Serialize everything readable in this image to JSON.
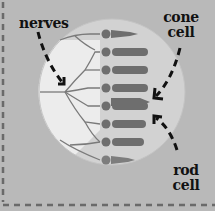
{
  "diagram": {
    "labels": {
      "nerves": "nerves",
      "cone_line1": "cone",
      "cone_line2": "cell",
      "rod_line1": "rod",
      "rod_line2": "cell"
    },
    "colors": {
      "background": "#b9b9b9",
      "lens": "#e8e8e8",
      "lens_shadow": "#cfcfcf",
      "cells": "#6e6e6e",
      "nerve_lines": "#7a7a7a",
      "text": "#111111",
      "dashed_border": "#6a6a6a"
    }
  }
}
